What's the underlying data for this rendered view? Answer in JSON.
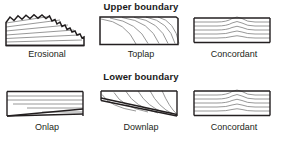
{
  "figure": {
    "sections": [
      {
        "id": "upper",
        "title": "Upper boundary"
      },
      {
        "id": "lower",
        "title": "Lower boundary"
      }
    ]
  },
  "colors": {
    "outline": "#231f20",
    "reflector": "#8c8c8c",
    "background": "#ffffff",
    "text": "#231f20"
  },
  "panels": {
    "erosional": {
      "label": "Erosional",
      "boundary": "upper",
      "description": "Inclined reflectors truncated by an irregular erosional upper surface"
    },
    "toplap": {
      "label": "Toplap",
      "boundary": "upper",
      "description": "Concave-up clinoforms terminating against a flat upper surface"
    },
    "concordant_upper": {
      "label": "Concordant",
      "boundary": "upper",
      "description": "Reflectors parallel and conformable with the flat upper surface"
    },
    "onlap": {
      "label": "Onlap",
      "boundary": "lower",
      "description": "Horizontal reflectors terminating against an inclined lower surface"
    },
    "downlap": {
      "label": "Downlap",
      "boundary": "lower",
      "description": "Inclined clinoforms terminating down-dip against a lower surface"
    },
    "concordant_lower": {
      "label": "Concordant",
      "boundary": "lower",
      "description": "Reflectors parallel and conformable with the flat lower surface"
    }
  }
}
